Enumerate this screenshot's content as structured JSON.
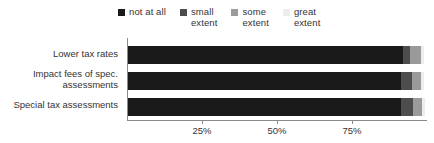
{
  "chart_data": {
    "type": "bar",
    "orientation": "horizontal",
    "stacked": true,
    "title": "",
    "subtitle": "",
    "xlabel": "",
    "ylabel": "",
    "xlim": [
      0,
      100
    ],
    "grid": false,
    "legend_position": "top",
    "xticks": [
      {
        "value": 25,
        "label": "25%"
      },
      {
        "value": 50,
        "label": "50%"
      },
      {
        "value": 75,
        "label": "75%"
      }
    ],
    "categories": [
      "Lower tax rates",
      "Impact fees of spec.\nassessments",
      "Special tax assessments"
    ],
    "series": [
      {
        "name": "not at all",
        "color": "#1a1a1a",
        "values": [
          91.5,
          91.0,
          91.0
        ]
      },
      {
        "name": "small extent",
        "color": "#4d4d4d",
        "values": [
          2.5,
          3.5,
          4.0
        ]
      },
      {
        "name": "some extent",
        "color": "#9a9a9a",
        "values": [
          3.5,
          3.0,
          3.0
        ]
      },
      {
        "name": "great extent",
        "color": "#ededed",
        "values": [
          1.0,
          1.0,
          1.0
        ]
      }
    ]
  },
  "legend": {
    "items": [
      {
        "label": "not at all",
        "color": "#1a1a1a"
      },
      {
        "label": "small\nextent",
        "color": "#4d4d4d"
      },
      {
        "label": "some\nextent",
        "color": "#9a9a9a"
      },
      {
        "label": "great\nextent",
        "color": "#ededed"
      }
    ]
  },
  "axis": {
    "line_color": "#8a8a8a"
  }
}
